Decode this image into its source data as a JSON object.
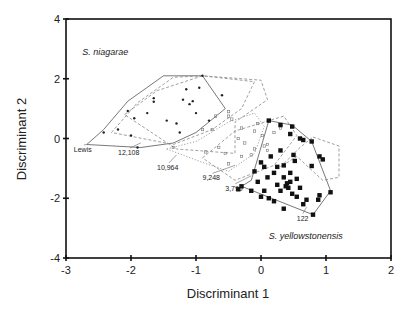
{
  "chart_data": {
    "type": "scatter",
    "title": "",
    "xlabel": "Discriminant 1",
    "ylabel": "Discriminant 2",
    "xlim": [
      -3,
      2
    ],
    "ylim": [
      -4,
      4
    ],
    "xticks": [
      -3,
      -2,
      -1,
      0,
      1,
      2
    ],
    "yticks": [
      -4,
      -2,
      0,
      2,
      4
    ],
    "grid": false,
    "legend": null,
    "annotations": [
      {
        "text": "S. niagarae",
        "x": -2.75,
        "y": 2.8,
        "style": "italic"
      },
      {
        "text": "S. yellowstonensis",
        "x": 0.12,
        "y": -3.35,
        "style": "italic"
      },
      {
        "text": "Lewis",
        "x": -2.88,
        "y": -0.45,
        "pointer_to": [
          -2.68,
          -0.2
        ]
      },
      {
        "text": "12,108",
        "x": -2.2,
        "y": -0.55,
        "pointer_to": [
          -1.85,
          -0.15
        ]
      },
      {
        "text": "10,964",
        "x": -1.6,
        "y": -1.05,
        "pointer_to": [
          -1.3,
          -0.55
        ]
      },
      {
        "text": "9,248",
        "x": -0.9,
        "y": -1.4,
        "pointer_to": [
          -0.4,
          -0.9
        ]
      },
      {
        "text": "3,790",
        "x": -0.55,
        "y": -1.75,
        "pointer_to": [
          -0.15,
          -1.25
        ]
      },
      {
        "text": "122",
        "x": 0.55,
        "y": -2.75,
        "pointer_to": [
          0.7,
          -2.3
        ]
      }
    ],
    "series": [
      {
        "name": "S. niagarae (Lewis / upstream)",
        "marker": "small-filled-circle",
        "points": [
          [
            -2.05,
            0.92
          ],
          [
            -1.95,
            0.68
          ],
          [
            -2.2,
            0.3
          ],
          [
            -2.0,
            0.1
          ],
          [
            -1.75,
            0.85
          ],
          [
            -1.45,
            0.6
          ],
          [
            -1.3,
            0.5
          ],
          [
            -1.65,
            1.23
          ],
          [
            -1.65,
            1.35
          ],
          [
            -1.15,
            1.65
          ],
          [
            -0.95,
            1.7
          ],
          [
            -1.2,
            1.3
          ],
          [
            -1.1,
            1.15
          ],
          [
            -1.05,
            1.25
          ],
          [
            -0.6,
            1.45
          ],
          [
            -1.0,
            0.85
          ],
          [
            -0.8,
            0.6
          ],
          [
            -1.25,
            0.2
          ],
          [
            -2.42,
            0.2
          ],
          [
            -1.9,
            -0.3
          ],
          [
            -0.9,
            2.1
          ]
        ]
      },
      {
        "name": "Intermediate sites",
        "marker": "small-open-square",
        "points": [
          [
            -1.35,
            -0.3
          ],
          [
            -0.9,
            0.3
          ],
          [
            -0.75,
            0.3
          ],
          [
            -0.5,
            0.9
          ],
          [
            -0.45,
            0.65
          ],
          [
            -0.55,
            -0.5
          ],
          [
            -0.3,
            0.35
          ],
          [
            -0.35,
            0.0
          ],
          [
            -0.1,
            0.25
          ],
          [
            0.02,
            0.1
          ],
          [
            -0.5,
            0.75
          ],
          [
            -0.7,
            0.75
          ],
          [
            -0.25,
            -0.15
          ],
          [
            -0.1,
            -0.35
          ],
          [
            0.05,
            -0.25
          ],
          [
            -0.3,
            -0.6
          ],
          [
            -0.5,
            -0.85
          ],
          [
            -0.65,
            -0.3
          ],
          [
            0.1,
            -0.4
          ],
          [
            0.1,
            -0.2
          ],
          [
            0.2,
            0.2
          ],
          [
            0.3,
            0.35
          ],
          [
            -0.85,
            -0.45
          ],
          [
            -0.05,
            0.5
          ],
          [
            -0.15,
            -0.55
          ]
        ]
      },
      {
        "name": "S. yellowstonensis",
        "marker": "filled-square",
        "points": [
          [
            0.12,
            0.6
          ],
          [
            0.3,
            0.45
          ],
          [
            0.48,
            0.4
          ],
          [
            0.45,
            0.15
          ],
          [
            0.6,
            0.0
          ],
          [
            0.65,
            -0.05
          ],
          [
            0.78,
            -0.1
          ],
          [
            0.9,
            -0.6
          ],
          [
            0.95,
            -0.7
          ],
          [
            0.3,
            -0.4
          ],
          [
            0.15,
            -0.6
          ],
          [
            0.0,
            -0.8
          ],
          [
            0.05,
            -0.95
          ],
          [
            0.25,
            -0.95
          ],
          [
            0.2,
            -1.15
          ],
          [
            0.35,
            -0.9
          ],
          [
            0.52,
            -0.75
          ],
          [
            0.5,
            -0.55
          ],
          [
            0.78,
            -0.92
          ],
          [
            1.07,
            -1.8
          ],
          [
            -0.1,
            -1.1
          ],
          [
            -0.05,
            -1.45
          ],
          [
            0.35,
            -1.3
          ],
          [
            0.45,
            -1.15
          ],
          [
            0.55,
            -1.35
          ],
          [
            0.4,
            -1.5
          ],
          [
            0.38,
            -1.6
          ],
          [
            0.45,
            -1.45
          ],
          [
            0.3,
            -1.75
          ],
          [
            0.25,
            -1.55
          ],
          [
            0.6,
            -1.65
          ],
          [
            0.2,
            -2.1
          ],
          [
            0.12,
            -2.0
          ],
          [
            0.0,
            -1.95
          ],
          [
            0.05,
            -1.75
          ],
          [
            -0.15,
            -1.75
          ],
          [
            -0.3,
            -1.6
          ],
          [
            -0.35,
            -1.7
          ],
          [
            0.7,
            -2.05
          ],
          [
            0.65,
            -2.2
          ],
          [
            0.9,
            -1.9
          ],
          [
            0.88,
            -2.05
          ],
          [
            0.35,
            -2.35
          ],
          [
            0.8,
            -2.55
          ],
          [
            0.1,
            -1.3
          ],
          [
            0.55,
            -1.95
          ],
          [
            0.42,
            -1.65
          ],
          [
            0.48,
            -1.85
          ]
        ]
      }
    ],
    "hulls": [
      {
        "name": "Lewis",
        "style": "solid",
        "points": [
          [
            -2.68,
            -0.2
          ],
          [
            -2.42,
            0.3
          ],
          [
            -2.05,
            1.25
          ],
          [
            -1.5,
            2.1
          ],
          [
            -1.35,
            2.1
          ],
          [
            -0.9,
            2.1
          ],
          [
            -0.55,
            1.0
          ],
          [
            -1.0,
            0.2
          ],
          [
            -1.35,
            -0.15
          ],
          [
            -1.85,
            -0.3
          ]
        ]
      },
      {
        "name": "12,108",
        "style": "dashed",
        "points": [
          [
            -2.3,
            0.2
          ],
          [
            -1.9,
            1.2
          ],
          [
            -1.35,
            2.05
          ],
          [
            -0.9,
            2.1
          ],
          [
            -0.1,
            1.9
          ],
          [
            -0.3,
            1.0
          ],
          [
            -0.75,
            0.3
          ],
          [
            -1.35,
            -0.2
          ]
        ]
      },
      {
        "name": "10,964",
        "style": "dashed",
        "points": [
          [
            -2.1,
            0.8
          ],
          [
            -1.6,
            1.6
          ],
          [
            -0.9,
            2.1
          ],
          [
            0.0,
            1.95
          ],
          [
            0.1,
            1.3
          ],
          [
            -0.4,
            0.55
          ],
          [
            -0.4,
            -0.5
          ],
          [
            -1.3,
            -0.35
          ]
        ]
      },
      {
        "name": "9,248",
        "style": "dotted",
        "points": [
          [
            -1.45,
            -0.35
          ],
          [
            -1.0,
            -0.1
          ],
          [
            -0.5,
            0.55
          ],
          [
            -0.1,
            0.85
          ],
          [
            0.05,
            0.4
          ],
          [
            -0.1,
            -0.5
          ],
          [
            -0.5,
            -1.1
          ],
          [
            -0.9,
            -0.8
          ]
        ]
      },
      {
        "name": "3,790",
        "style": "dashed",
        "points": [
          [
            -0.9,
            -0.65
          ],
          [
            -0.4,
            0.25
          ],
          [
            0.35,
            0.75
          ],
          [
            0.55,
            0.1
          ],
          [
            0.2,
            -0.9
          ],
          [
            -0.4,
            -1.4
          ]
        ]
      },
      {
        "name": "122",
        "style": "solid",
        "points": [
          [
            0.12,
            0.6
          ],
          [
            0.48,
            0.45
          ],
          [
            0.78,
            -0.1
          ],
          [
            1.07,
            -1.75
          ],
          [
            0.8,
            -2.55
          ],
          [
            -0.3,
            -1.6
          ],
          [
            -0.15,
            -1.4
          ]
        ]
      },
      {
        "name": "122-outer",
        "style": "dashed",
        "points": [
          [
            0.8,
            0.05
          ],
          [
            1.2,
            -0.25
          ],
          [
            1.2,
            -1.3
          ],
          [
            0.95,
            -1.4
          ],
          [
            0.55,
            -0.6
          ],
          [
            0.3,
            -0.95
          ],
          [
            0.6,
            -0.3
          ]
        ]
      }
    ]
  }
}
